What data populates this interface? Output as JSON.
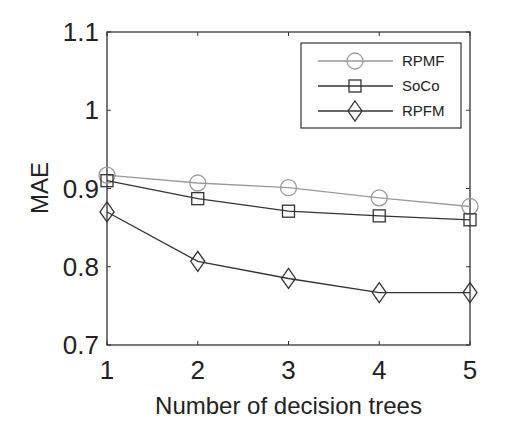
{
  "chart_data": {
    "type": "line",
    "title": "",
    "xlabel": "Number of decision trees",
    "ylabel": "MAE",
    "x": [
      1,
      2,
      3,
      4,
      5
    ],
    "xlim": [
      1,
      5
    ],
    "ylim": [
      0.7,
      1.1
    ],
    "yticks": [
      "0.7",
      "0.8",
      "0.9",
      "1",
      "1.1"
    ],
    "xticks": [
      "1",
      "2",
      "3",
      "4",
      "5"
    ],
    "grid": false,
    "legend_position": "upper right",
    "series": [
      {
        "name": "RPMF",
        "marker": "circle",
        "color": "#9a9a9a",
        "values": [
          0.917,
          0.907,
          0.901,
          0.888,
          0.877
        ]
      },
      {
        "name": "SoCo",
        "marker": "square",
        "color": "#333333",
        "values": [
          0.91,
          0.887,
          0.871,
          0.865,
          0.86
        ]
      },
      {
        "name": "RPFM",
        "marker": "diamond",
        "color": "#333333",
        "values": [
          0.87,
          0.807,
          0.785,
          0.767,
          0.767
        ]
      }
    ],
    "cropped_neighbor_label": "RMSE"
  }
}
